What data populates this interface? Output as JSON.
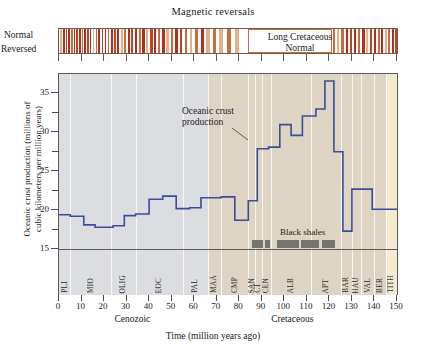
{
  "figure": {
    "mag_panel_title": "Magnetic reversals",
    "mag_normal_label": "Normal",
    "mag_reversed_label": "Reversed",
    "long_cretaceous_normal_label": "Long Cretaceous\nNormal",
    "long_cretaceous_normal_line1": "Long Cretaceous",
    "long_cretaceous_normal_line2": "Normal",
    "curve_annotation": "Oceanic crust production",
    "black_shales_label": "Black shales"
  },
  "chart_data": {
    "type": "line",
    "xlabel": "Time (million years ago)",
    "ylabel": "Oceanic crust production (millions of cubic kilometers per million years)",
    "ylabel_line1": "Oceanic crust production (millions of",
    "ylabel_line2": "cubic kilometers per million years)",
    "xlim": [
      0,
      150
    ],
    "ylim": [
      15,
      37.5
    ],
    "xticks": [
      0,
      10,
      20,
      30,
      40,
      50,
      60,
      70,
      80,
      90,
      100,
      110,
      120,
      130,
      140,
      150
    ],
    "xtick_labels": [
      "0",
      "10",
      "20",
      "30",
      "40",
      "50",
      "60",
      "70",
      "80",
      "90",
      "100",
      "110",
      "120",
      "130",
      "140",
      "150"
    ],
    "yticks": [
      15,
      20,
      25,
      30,
      35
    ],
    "ytick_labels": [
      "15",
      "20",
      "25",
      "30",
      "35"
    ],
    "yminor_ticks": [
      17.5,
      22.5,
      27.5,
      32.5
    ],
    "grid": "vertical-only",
    "legend": "none",
    "series": [
      {
        "name": "Oceanic crust production",
        "style": "step",
        "color": "#3b4c9a",
        "steps": [
          {
            "x0": 0,
            "x1": 5,
            "y": 19.4
          },
          {
            "x0": 5,
            "x1": 11,
            "y": 19.2
          },
          {
            "x0": 11,
            "x1": 16,
            "y": 18.1
          },
          {
            "x0": 16,
            "x1": 24,
            "y": 17.8
          },
          {
            "x0": 24,
            "x1": 29,
            "y": 18.0
          },
          {
            "x0": 29,
            "x1": 34,
            "y": 19.3
          },
          {
            "x0": 34,
            "x1": 40,
            "y": 19.5
          },
          {
            "x0": 40,
            "x1": 46,
            "y": 21.4
          },
          {
            "x0": 46,
            "x1": 52,
            "y": 21.8
          },
          {
            "x0": 52,
            "x1": 58,
            "y": 20.2
          },
          {
            "x0": 58,
            "x1": 63,
            "y": 20.3
          },
          {
            "x0": 63,
            "x1": 72,
            "y": 21.6
          },
          {
            "x0": 72,
            "x1": 78,
            "y": 21.7
          },
          {
            "x0": 78,
            "x1": 84,
            "y": 18.7
          },
          {
            "x0": 84,
            "x1": 88,
            "y": 21.2
          },
          {
            "x0": 88,
            "x1": 93,
            "y": 27.9
          },
          {
            "x0": 93,
            "x1": 98,
            "y": 28.1
          },
          {
            "x0": 98,
            "x1": 103,
            "y": 31.0
          },
          {
            "x0": 103,
            "x1": 108,
            "y": 29.6
          },
          {
            "x0": 108,
            "x1": 114,
            "y": 32.1
          },
          {
            "x0": 114,
            "x1": 118,
            "y": 33.0
          },
          {
            "x0": 118,
            "x1": 122,
            "y": 36.6
          },
          {
            "x0": 122,
            "x1": 126,
            "y": 27.5
          },
          {
            "x0": 126,
            "x1": 130,
            "y": 17.3
          },
          {
            "x0": 130,
            "x1": 139,
            "y": 22.7
          },
          {
            "x0": 139,
            "x1": 150,
            "y": 20.1
          }
        ]
      }
    ],
    "eras": [
      {
        "name": "Cenozoic",
        "x0": 0,
        "x1": 66,
        "label_x": 33,
        "color": "#dcdde0"
      },
      {
        "name": "Cretaceous",
        "x0": 66,
        "x1": 145,
        "label_x": 104,
        "color": "#ded4c3"
      },
      {
        "name": "",
        "x0": 145,
        "x1": 150,
        "label_x": 147,
        "color": "#f3ead0"
      }
    ],
    "stages": [
      {
        "abbr": "PLI",
        "x0": 0,
        "x1": 5,
        "color": "#dcdde0"
      },
      {
        "abbr": "MIO",
        "x0": 5,
        "x1": 23,
        "color": "#dcdde0"
      },
      {
        "abbr": "OLIG",
        "x0": 23,
        "x1": 34,
        "color": "#dcdde0"
      },
      {
        "abbr": "EOC",
        "x0": 34,
        "x1": 55,
        "color": "#dcdde0"
      },
      {
        "abbr": "PAL",
        "x0": 55,
        "x1": 66,
        "color": "#dcdde0"
      },
      {
        "abbr": "MAA",
        "x0": 66,
        "x1": 72,
        "color": "#ded4c3"
      },
      {
        "abbr": "CMP",
        "x0": 72,
        "x1": 84,
        "color": "#ded4c3"
      },
      {
        "abbr": "SAN",
        "x0": 84,
        "x1": 87,
        "color": "#ded4c3"
      },
      {
        "abbr": "CT",
        "x0": 87,
        "x1": 90,
        "color": "#ded4c3"
      },
      {
        "abbr": "CEN",
        "x0": 90,
        "x1": 94,
        "color": "#ded4c3"
      },
      {
        "abbr": "ALB",
        "x0": 94,
        "x1": 112,
        "color": "#ded4c3"
      },
      {
        "abbr": "APT",
        "x0": 112,
        "x1": 125,
        "color": "#ded4c3"
      },
      {
        "abbr": "BAR",
        "x0": 125,
        "x1": 130,
        "color": "#ded4c3"
      },
      {
        "abbr": "HAU",
        "x0": 130,
        "x1": 134,
        "color": "#ded4c3"
      },
      {
        "abbr": "VAL",
        "x0": 134,
        "x1": 140,
        "color": "#ded4c3"
      },
      {
        "abbr": "BER",
        "x0": 140,
        "x1": 145,
        "color": "#ded4c3"
      },
      {
        "abbr": "TITH",
        "x0": 145,
        "x1": 150,
        "color": "#f3ead0"
      }
    ],
    "black_shales_bars": [
      {
        "x0": 86,
        "x1": 91
      },
      {
        "x0": 92,
        "x1": 94
      },
      {
        "x0": 97,
        "x1": 107
      },
      {
        "x0": 108,
        "x1": 116
      },
      {
        "x0": 117,
        "x1": 123
      }
    ],
    "magnetic_reversals": {
      "normal_color_dark": "#b0301c",
      "normal_color_mid": "#cf6a3a",
      "normal_color_light": "#e3b48c",
      "background": "#ffffff",
      "long_normal_x0": 84,
      "long_normal_x1": 121,
      "normal_bands": [
        {
          "x0": 0.5,
          "x1": 1.3,
          "c": "#e3b48c"
        },
        {
          "x0": 1.8,
          "x1": 2.6,
          "c": "#b0301c"
        },
        {
          "x0": 3.0,
          "x1": 3.7,
          "c": "#c24428"
        },
        {
          "x0": 4.1,
          "x1": 4.9,
          "c": "#b0301c"
        },
        {
          "x0": 5.3,
          "x1": 6.1,
          "c": "#cf6a3a"
        },
        {
          "x0": 6.5,
          "x1": 7.2,
          "c": "#b0301c"
        },
        {
          "x0": 7.6,
          "x1": 8.4,
          "c": "#c24428"
        },
        {
          "x0": 8.8,
          "x1": 9.6,
          "c": "#b0301c"
        },
        {
          "x0": 10.0,
          "x1": 10.8,
          "c": "#cf6a3a"
        },
        {
          "x0": 11.2,
          "x1": 11.9,
          "c": "#b0301c"
        },
        {
          "x0": 12.3,
          "x1": 13.1,
          "c": "#c24428"
        },
        {
          "x0": 13.6,
          "x1": 14.4,
          "c": "#b0301c"
        },
        {
          "x0": 14.9,
          "x1": 15.7,
          "c": "#e3b48c"
        },
        {
          "x0": 16.2,
          "x1": 17.0,
          "c": "#cf6a3a"
        },
        {
          "x0": 17.5,
          "x1": 18.4,
          "c": "#b0301c"
        },
        {
          "x0": 18.9,
          "x1": 19.7,
          "c": "#c24428"
        },
        {
          "x0": 20.2,
          "x1": 21.0,
          "c": "#b0301c"
        },
        {
          "x0": 21.6,
          "x1": 22.4,
          "c": "#cf6a3a"
        },
        {
          "x0": 23.0,
          "x1": 23.9,
          "c": "#b0301c"
        },
        {
          "x0": 24.4,
          "x1": 25.3,
          "c": "#c24428"
        },
        {
          "x0": 25.9,
          "x1": 26.8,
          "c": "#b0301c"
        },
        {
          "x0": 27.4,
          "x1": 28.3,
          "c": "#e3b48c"
        },
        {
          "x0": 28.9,
          "x1": 29.8,
          "c": "#cf6a3a"
        },
        {
          "x0": 30.4,
          "x1": 31.4,
          "c": "#b0301c"
        },
        {
          "x0": 32.0,
          "x1": 33.0,
          "c": "#c24428"
        },
        {
          "x0": 33.6,
          "x1": 34.6,
          "c": "#b0301c"
        },
        {
          "x0": 35.3,
          "x1": 36.3,
          "c": "#cf6a3a"
        },
        {
          "x0": 37.0,
          "x1": 38.0,
          "c": "#b0301c"
        },
        {
          "x0": 38.7,
          "x1": 39.7,
          "c": "#e3b48c"
        },
        {
          "x0": 40.4,
          "x1": 41.5,
          "c": "#c24428"
        },
        {
          "x0": 42.2,
          "x1": 43.2,
          "c": "#b0301c"
        },
        {
          "x0": 44.0,
          "x1": 45.0,
          "c": "#cf6a3a"
        },
        {
          "x0": 45.8,
          "x1": 46.9,
          "c": "#b0301c"
        },
        {
          "x0": 47.7,
          "x1": 48.8,
          "c": "#e3b48c"
        },
        {
          "x0": 49.6,
          "x1": 50.7,
          "c": "#cf6a3a"
        },
        {
          "x0": 51.6,
          "x1": 52.7,
          "c": "#b0301c"
        },
        {
          "x0": 53.6,
          "x1": 54.8,
          "c": "#c24428"
        },
        {
          "x0": 55.8,
          "x1": 57.0,
          "c": "#cf6a3a"
        },
        {
          "x0": 58.0,
          "x1": 59.2,
          "c": "#e3b48c"
        },
        {
          "x0": 60.3,
          "x1": 61.6,
          "c": "#cf6a3a"
        },
        {
          "x0": 62.8,
          "x1": 64.2,
          "c": "#b0301c"
        },
        {
          "x0": 65.4,
          "x1": 66.8,
          "c": "#e3b48c"
        },
        {
          "x0": 68.2,
          "x1": 69.8,
          "c": "#cf6a3a"
        },
        {
          "x0": 71.2,
          "x1": 72.9,
          "c": "#e3b48c"
        },
        {
          "x0": 74.5,
          "x1": 76.4,
          "c": "#cf6a3a"
        },
        {
          "x0": 78.0,
          "x1": 80.1,
          "c": "#e3b48c"
        },
        {
          "x0": 121.5,
          "x1": 122.6,
          "c": "#cf6a3a"
        },
        {
          "x0": 123.4,
          "x1": 124.4,
          "c": "#e3b48c"
        },
        {
          "x0": 125.2,
          "x1": 126.3,
          "c": "#cf6a3a"
        },
        {
          "x0": 127.2,
          "x1": 128.3,
          "c": "#b0301c"
        },
        {
          "x0": 129.1,
          "x1": 130.2,
          "c": "#c24428"
        },
        {
          "x0": 131.0,
          "x1": 132.0,
          "c": "#b0301c"
        },
        {
          "x0": 132.8,
          "x1": 133.8,
          "c": "#cf6a3a"
        },
        {
          "x0": 134.6,
          "x1": 135.6,
          "c": "#b0301c"
        },
        {
          "x0": 136.3,
          "x1": 137.2,
          "c": "#e3b48c"
        },
        {
          "x0": 138.0,
          "x1": 138.9,
          "c": "#c24428"
        },
        {
          "x0": 139.7,
          "x1": 140.6,
          "c": "#b0301c"
        },
        {
          "x0": 141.4,
          "x1": 142.3,
          "c": "#cf6a3a"
        },
        {
          "x0": 143.0,
          "x1": 143.9,
          "c": "#b0301c"
        },
        {
          "x0": 144.6,
          "x1": 145.5,
          "c": "#e3b48c"
        },
        {
          "x0": 146.2,
          "x1": 147.1,
          "c": "#cf6a3a"
        },
        {
          "x0": 147.8,
          "x1": 148.7,
          "c": "#b0301c"
        },
        {
          "x0": 149.2,
          "x1": 150.0,
          "c": "#c24428"
        }
      ]
    }
  }
}
